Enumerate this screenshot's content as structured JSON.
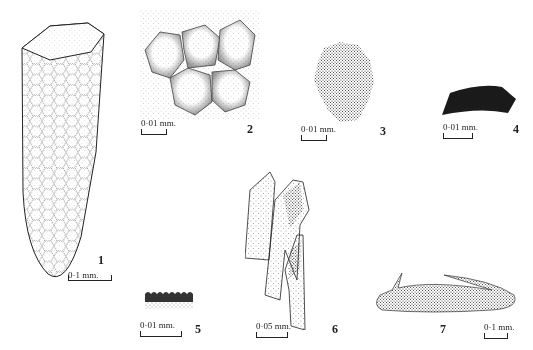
{
  "plate": {
    "figures": [
      {
        "number": "1",
        "scale": "0·1 mm.",
        "description": "elongated conical structure with hexagonal reticulate surface"
      },
      {
        "number": "2",
        "scale": "0·01 mm.",
        "description": "cluster of rounded polygonal cells"
      },
      {
        "number": "3",
        "scale": "0·01 mm.",
        "description": "densely stippled irregular fragment"
      },
      {
        "number": "4",
        "scale": "0·01 mm.",
        "description": "dark curved fragment"
      },
      {
        "number": "5",
        "scale": "0·01 mm.",
        "description": "small crenulate-edged fragment"
      },
      {
        "number": "6",
        "scale": "0·05 mm.",
        "description": "overlapping elongated stippled fragments"
      },
      {
        "number": "7",
        "scale": "0·1 mm.",
        "description": "elongated curved body with hooked ends"
      }
    ]
  },
  "colors": {
    "ink": "#222222",
    "background": "#ffffff"
  }
}
